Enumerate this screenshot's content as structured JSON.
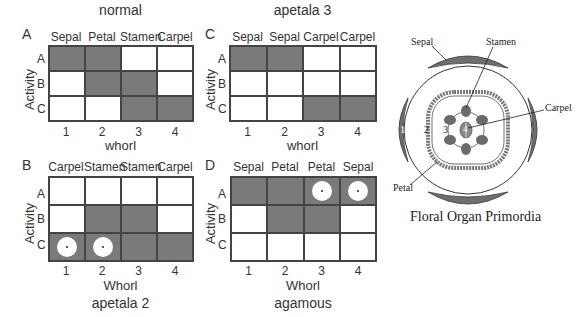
{
  "panels": [
    {
      "id": "A",
      "letter": "A",
      "title": "normal",
      "title_position": "top",
      "columns": [
        "Sepal",
        "Petal",
        "Stamen",
        "Carpel"
      ],
      "rows": [
        "A",
        "B",
        "C"
      ],
      "ylabel": "Activity",
      "xlabel": "whorl",
      "xticks": [
        "1",
        "2",
        "3",
        "4"
      ],
      "cells": [
        [
          1,
          1,
          0,
          0
        ],
        [
          0,
          1,
          1,
          0
        ],
        [
          0,
          0,
          1,
          1
        ]
      ],
      "dots": [
        [
          0,
          0,
          0,
          0
        ],
        [
          0,
          0,
          0,
          0
        ],
        [
          0,
          0,
          0,
          0
        ]
      ]
    },
    {
      "id": "C",
      "letter": "C",
      "title": "apetala 3",
      "title_position": "top",
      "columns": [
        "Sepal",
        "Sepal",
        "Carpel",
        "Carpel"
      ],
      "rows": [
        "A",
        "B",
        "C"
      ],
      "ylabel": "Activity",
      "xlabel": "whorl",
      "xticks": [
        "1",
        "2",
        "3",
        "4"
      ],
      "cells": [
        [
          1,
          1,
          0,
          0
        ],
        [
          0,
          0,
          0,
          0
        ],
        [
          0,
          0,
          1,
          1
        ]
      ],
      "dots": [
        [
          0,
          0,
          0,
          0
        ],
        [
          0,
          0,
          0,
          0
        ],
        [
          0,
          0,
          0,
          0
        ]
      ]
    },
    {
      "id": "B",
      "letter": "B",
      "title": "apetala 2",
      "title_position": "bottom",
      "columns": [
        "Carpel",
        "Stamen",
        "Stamen",
        "Carpel"
      ],
      "rows": [
        "A",
        "B",
        "C"
      ],
      "ylabel": "Activity",
      "xlabel": "Whorl",
      "xticks": [
        "1",
        "2",
        "3",
        "4"
      ],
      "cells": [
        [
          0,
          0,
          0,
          0
        ],
        [
          0,
          1,
          1,
          0
        ],
        [
          1,
          1,
          1,
          1
        ]
      ],
      "dots": [
        [
          0,
          0,
          0,
          0
        ],
        [
          0,
          0,
          0,
          0
        ],
        [
          1,
          1,
          0,
          0
        ]
      ]
    },
    {
      "id": "D",
      "letter": "D",
      "title": "agamous",
      "title_position": "bottom",
      "columns": [
        "Sepal",
        "Petal",
        "Petal",
        "Sepal"
      ],
      "rows": [
        "A",
        "B",
        "C"
      ],
      "ylabel": "Activity",
      "xlabel": "Whorl",
      "xticks": [
        "1",
        "2",
        "3",
        "4"
      ],
      "cells": [
        [
          1,
          1,
          1,
          1
        ],
        [
          0,
          1,
          1,
          0
        ],
        [
          0,
          0,
          0,
          0
        ]
      ],
      "dots": [
        [
          0,
          0,
          1,
          1
        ],
        [
          0,
          0,
          0,
          0
        ],
        [
          0,
          0,
          0,
          0
        ]
      ]
    }
  ],
  "flower": {
    "caption": "Floral Organ Primordia",
    "labels": {
      "sepal": "Sepal",
      "stamen": "Stamen",
      "carpel": "Carpel",
      "petal": "Petal"
    },
    "whorl_numbers": [
      "1",
      "2",
      "3",
      "4"
    ]
  },
  "colors": {
    "active_cell": "#7a7a7a",
    "inactive_cell": "#ffffff",
    "grid_line": "#444444",
    "organ_fill": "#6e6e6e"
  }
}
